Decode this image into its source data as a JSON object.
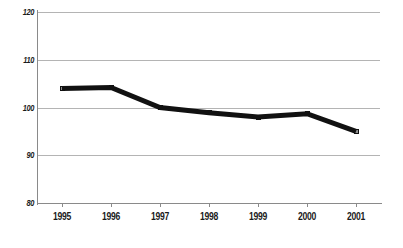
{
  "chart_data": {
    "type": "line",
    "title": "",
    "subtitle": "",
    "xlabel": "",
    "ylabel": "",
    "categories": [
      "1995",
      "1996",
      "1997",
      "1998",
      "1999",
      "2000",
      "2001"
    ],
    "values": [
      104,
      104.2,
      100,
      98.9,
      98,
      98.7,
      95
    ],
    "series": [
      {
        "name": "",
        "values": [
          104,
          104.2,
          100,
          98.9,
          98,
          98.7,
          95
        ]
      }
    ],
    "ylim": [
      80,
      120
    ],
    "yticks": [
      80,
      90,
      100,
      110,
      120
    ],
    "ytick_labels": [
      "80",
      "90",
      "100",
      "110",
      "120"
    ],
    "xtick_labels": [
      "1995",
      "1996",
      "1997",
      "1998",
      "1999",
      "2000",
      "2001"
    ],
    "grid": "horizontal",
    "legend": "none",
    "line_color": "#111111",
    "marker_fill": "#8e8e8e",
    "marker_edge": "#111111",
    "gridline_color": "#b4b4b4",
    "axis_color": "#8a8a8a",
    "background_color": "#ffffff"
  }
}
